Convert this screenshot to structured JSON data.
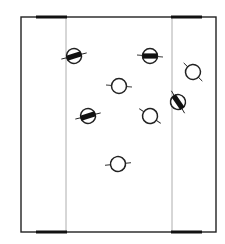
{
  "diagram": {
    "colors": {
      "line": "#222222",
      "thin_line": "#9a9a9a",
      "fill": "#111111",
      "background": "#ffffff"
    },
    "frame": {
      "x": 21,
      "y": 17,
      "w": 195,
      "h": 215
    },
    "dividers": [
      66,
      172
    ],
    "thick_bars": [
      {
        "x1": 36,
        "x2": 67,
        "y": 17
      },
      {
        "x1": 171,
        "x2": 202,
        "y": 17
      },
      {
        "x1": 36,
        "x2": 67,
        "y": 232
      },
      {
        "x1": 171,
        "x2": 202,
        "y": 232
      }
    ],
    "symbols": [
      {
        "id": "a",
        "cx": 74,
        "cy": 56,
        "filled": true,
        "angle": -18
      },
      {
        "id": "b",
        "cx": 150,
        "cy": 56,
        "filled": true,
        "angle": 0
      },
      {
        "id": "c",
        "cx": 193,
        "cy": 72,
        "filled": false,
        "angle": 40
      },
      {
        "id": "d",
        "cx": 119,
        "cy": 86,
        "filled": false,
        "angle": 0
      },
      {
        "id": "e",
        "cx": 178,
        "cy": 102,
        "filled": true,
        "angle": 55
      },
      {
        "id": "f",
        "cx": 88,
        "cy": 116,
        "filled": true,
        "angle": -18
      },
      {
        "id": "g",
        "cx": 150,
        "cy": 116,
        "filled": false,
        "angle": 30
      },
      {
        "id": "h",
        "cx": 118,
        "cy": 164,
        "filled": false,
        "angle": -10
      }
    ]
  }
}
